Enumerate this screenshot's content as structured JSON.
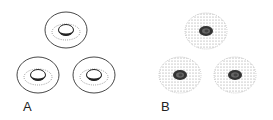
{
  "panels": [
    {
      "label": "A",
      "style": "outlined cells with dotted ring and crescent central body"
    },
    {
      "label": "B",
      "style": "stippled cells with dark nucleus"
    }
  ],
  "colors": {
    "stroke": "#222222",
    "stipple": "#888888",
    "nucleus": "#333333"
  }
}
